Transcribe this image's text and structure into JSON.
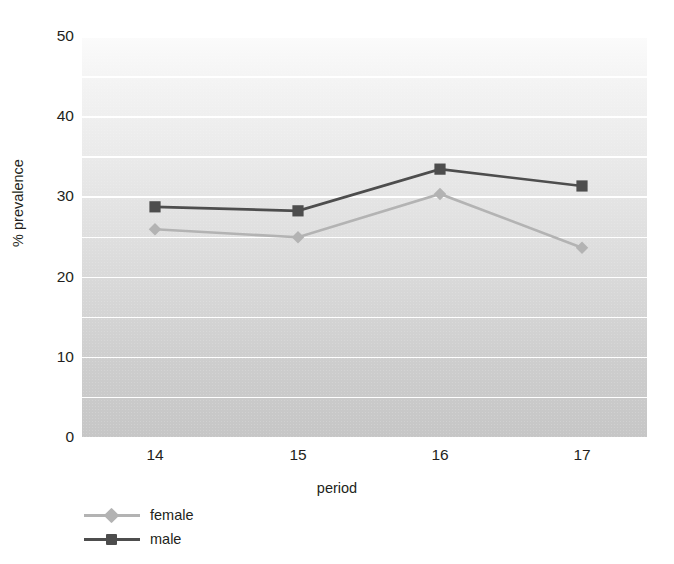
{
  "chart_data": {
    "type": "line",
    "title": "",
    "xlabel": "period",
    "ylabel": "% prevalence",
    "categories": [
      "14",
      "15",
      "16",
      "17"
    ],
    "x": [
      14,
      15,
      16,
      17
    ],
    "series": [
      {
        "name": "female",
        "marker": "diamond",
        "color": "#b3b3b3",
        "values": [
          25.9,
          24.9,
          30.3,
          23.6
        ]
      },
      {
        "name": "male",
        "marker": "square",
        "color": "#4d4d4d",
        "values": [
          28.7,
          28.2,
          33.4,
          31.3
        ]
      }
    ],
    "ylim": [
      0,
      50
    ],
    "y_ticks": [
      0,
      10,
      20,
      30,
      40,
      50
    ],
    "y_tick_labels": [
      "0",
      "10",
      "20",
      "30",
      "40",
      "50"
    ],
    "y_gridlines": [
      5,
      10,
      15,
      20,
      25,
      30,
      35,
      40,
      45,
      50
    ],
    "grid": true,
    "grid_color": "#ffffff",
    "legend_position": "below-left",
    "plot_background": "vertical-gray-gradient"
  },
  "axes": {
    "y_title": "% prevalence",
    "x_title": "period"
  },
  "legend": {
    "entries": [
      {
        "label": "female",
        "marker": "diamond-marker",
        "color": "#b3b3b3"
      },
      {
        "label": "male",
        "marker": "square-marker",
        "color": "#4d4d4d"
      }
    ]
  }
}
